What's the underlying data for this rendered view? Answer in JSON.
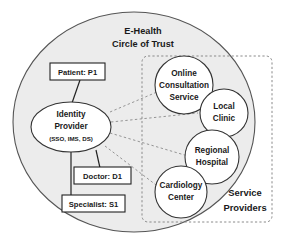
{
  "diagram": {
    "title_line1": "E-Health",
    "title_line2": "Circle of Trust",
    "trust_boundary_name": "E-Health Circle of Trust",
    "service_providers_label_line1": "Service",
    "service_providers_label_line2": "Providers",
    "identity_provider": {
      "line1": "Identity",
      "line2": "Provider",
      "line3": "(SSO, IMS, DS)"
    },
    "actors": [
      {
        "label": "Patient: P1"
      },
      {
        "label": "Doctor: D1"
      },
      {
        "label": "Specialist: S1"
      }
    ],
    "services": [
      {
        "line1": "Online",
        "line2": "Consultation",
        "line3": "Service"
      },
      {
        "line1": "Local",
        "line2": "Clinic",
        "line3": ""
      },
      {
        "line1": "Regional",
        "line2": "Hospital",
        "line3": ""
      },
      {
        "line1": "Cardiology",
        "line2": "Center",
        "line3": ""
      }
    ],
    "colors": {
      "background": "#ffffff",
      "trust_fill": "#ececec",
      "trust_stroke": "#555555",
      "node_fill": "#ffffff",
      "node_stroke": "#333333",
      "box_fill": "#ffffff",
      "box_stroke": "#222222",
      "dashed_stroke": "#888888",
      "solid_link": "#222222",
      "text": "#1a1a1a"
    }
  }
}
